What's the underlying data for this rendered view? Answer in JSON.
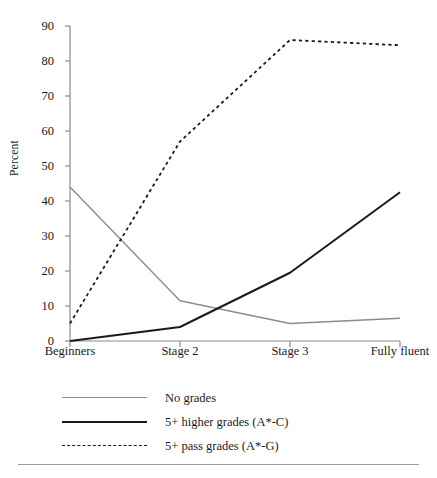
{
  "chart_data": {
    "type": "line",
    "title": "",
    "subtitle": "",
    "xlabel": "",
    "ylabel": "Percent",
    "categories": [
      "Beginners",
      "Stage 2",
      "Stage 3",
      "Fully fluent"
    ],
    "ylim": [
      0,
      90
    ],
    "ytick_values": [
      0,
      10,
      20,
      30,
      40,
      50,
      60,
      70,
      80,
      90
    ],
    "ytick_labels": [
      "0",
      "10",
      "20",
      "30",
      "40",
      "50",
      "60",
      "70",
      "80",
      "90"
    ],
    "grid": false,
    "legend_position": "below-plot-left",
    "series": [
      {
        "name": "No grades",
        "values": [
          44,
          11.5,
          5,
          6.5
        ],
        "color": "#8c8c8c",
        "style": "solid",
        "width": 1.4
      },
      {
        "name": "5+ higher grades (A*-C)",
        "values": [
          0,
          4,
          19.5,
          42.5
        ],
        "color": "#1a1a1a",
        "style": "solid",
        "width": 2.0
      },
      {
        "name": "5+ pass grades (A*-G)",
        "values": [
          5,
          57,
          86,
          84.5
        ],
        "color": "#1a1a1a",
        "style": "dotted",
        "width": 1.8
      }
    ],
    "axis_color": "#8c8c8c",
    "rule_color": "#9a9a9a"
  }
}
